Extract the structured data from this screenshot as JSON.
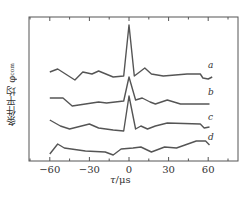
{
  "chart_data": {
    "type": "line",
    "title": "",
    "xlabel": "τ/μs",
    "ylabel": "条件平均 φ_com",
    "xlim": [
      -75,
      75
    ],
    "x_ticks_major": [
      -60,
      -30,
      0,
      30,
      60
    ],
    "x_ticks_minor": [
      -75,
      -45,
      -15,
      15,
      45,
      75
    ],
    "x_tick_labels": [
      "−60",
      "−30",
      "0",
      "30",
      "60"
    ],
    "grid": false,
    "legend_position": "inline labels at right end of each curve",
    "note": "y-values are relative offsets (arbitrary units, pixel-derived, higher = larger); curves vertically stacked",
    "series": [
      {
        "name": "a",
        "label_pos": [
          208,
          68
        ],
        "points": [
          [
            -60,
            72
          ],
          [
            -54,
            69
          ],
          [
            -41,
            80
          ],
          [
            -35,
            72
          ],
          [
            -28,
            74
          ],
          [
            -23,
            71
          ],
          [
            -12,
            77
          ],
          [
            -4,
            76
          ],
          [
            0,
            25
          ],
          [
            4,
            76
          ],
          [
            8,
            72
          ],
          [
            12,
            68
          ],
          [
            17,
            74
          ],
          [
            26,
            76
          ],
          [
            35,
            75
          ],
          [
            44,
            74
          ],
          [
            54,
            74
          ],
          [
            56,
            78
          ],
          [
            60,
            79
          ],
          [
            63,
            77
          ]
        ]
      },
      {
        "name": "b",
        "label_pos": [
          208,
          95
        ],
        "points": [
          [
            -60,
            98
          ],
          [
            -50,
            98
          ],
          [
            -43,
            106
          ],
          [
            -33,
            104
          ],
          [
            -23,
            102
          ],
          [
            -17,
            103
          ],
          [
            -4,
            101
          ],
          [
            0,
            77
          ],
          [
            5,
            100
          ],
          [
            10,
            98
          ],
          [
            16,
            102
          ],
          [
            20,
            104
          ],
          [
            29,
            100
          ],
          [
            39,
            104
          ],
          [
            54,
            104
          ],
          [
            61,
            104
          ]
        ]
      },
      {
        "name": "c",
        "label_pos": [
          208,
          120
        ],
        "points": [
          [
            -60,
            120
          ],
          [
            -52,
            126
          ],
          [
            -45,
            129
          ],
          [
            -30,
            124
          ],
          [
            -23,
            128
          ],
          [
            -12,
            130
          ],
          [
            -4,
            131
          ],
          [
            0,
            96
          ],
          [
            5,
            129
          ],
          [
            9,
            126
          ],
          [
            14,
            129
          ],
          [
            20,
            126
          ],
          [
            29,
            123
          ],
          [
            54,
            124
          ],
          [
            57,
            128
          ],
          [
            61,
            127
          ]
        ]
      },
      {
        "name": "d",
        "label_pos": [
          208,
          140
        ],
        "points": [
          [
            -60,
            154
          ],
          [
            -54,
            144
          ],
          [
            -49,
            148
          ],
          [
            -33,
            151
          ],
          [
            -18,
            152
          ],
          [
            -12,
            155
          ],
          [
            -6,
            149
          ],
          [
            3,
            148
          ],
          [
            9,
            147
          ],
          [
            17,
            152
          ],
          [
            27,
            147
          ],
          [
            36,
            148
          ],
          [
            51,
            141
          ],
          [
            58,
            141
          ],
          [
            61,
            145
          ]
        ]
      }
    ]
  },
  "labels": {
    "ylabel_main": "条件平均 φ",
    "ylabel_sub": "com",
    "xlabel_var": "τ",
    "xlabel_unit": "/μs"
  },
  "style": {
    "line_color": "#555555",
    "axis_color": "#555555",
    "text_color": "#333333"
  }
}
